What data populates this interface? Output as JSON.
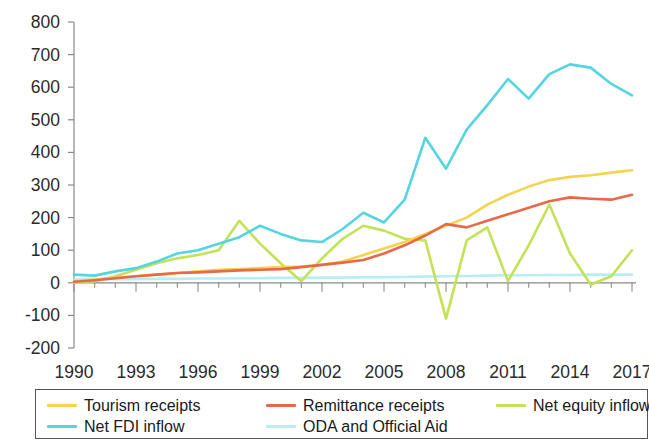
{
  "chart_data": {
    "type": "line",
    "title": "",
    "subtitle": "",
    "xlabel": "",
    "ylabel": "",
    "xlim": [
      1990,
      2017
    ],
    "ylim": [
      -200,
      800
    ],
    "ytick_values": [
      800,
      700,
      600,
      500,
      400,
      300,
      200,
      100,
      0,
      -100,
      -200
    ],
    "ytick_labels": [
      "800",
      "700",
      "600",
      "500",
      "400",
      "300",
      "200",
      "100",
      "0",
      "-100",
      "-200"
    ],
    "xtick_values": [
      1990,
      1993,
      1996,
      1999,
      2002,
      2005,
      2008,
      2011,
      2014,
      2017
    ],
    "xtick_labels": [
      "1990",
      "1993",
      "1996",
      "1999",
      "2002",
      "2005",
      "2008",
      "2011",
      "2014",
      "2017"
    ],
    "grid": false,
    "legend_position": "bottom",
    "x": [
      1990,
      1991,
      1992,
      1993,
      1994,
      1995,
      1996,
      1997,
      1998,
      1999,
      2000,
      2001,
      2002,
      2003,
      2004,
      2005,
      2006,
      2007,
      2008,
      2009,
      2010,
      2011,
      2012,
      2013,
      2014,
      2015,
      2016,
      2017
    ],
    "series": [
      {
        "name": "Tourism receipts",
        "color": "#f4d44e",
        "values": [
          5,
          10,
          15,
          20,
          25,
          30,
          35,
          40,
          42,
          45,
          48,
          50,
          55,
          65,
          85,
          105,
          125,
          150,
          175,
          200,
          240,
          270,
          295,
          315,
          325,
          330,
          338,
          345
        ]
      },
      {
        "name": "Remittance receipts",
        "color": "#e8694a",
        "values": [
          3,
          8,
          14,
          20,
          25,
          30,
          32,
          35,
          38,
          40,
          42,
          48,
          55,
          62,
          70,
          90,
          115,
          145,
          180,
          170,
          190,
          210,
          230,
          250,
          262,
          258,
          255,
          270
        ]
      },
      {
        "name": "Net equity inflow",
        "color": "#c2e356",
        "values": [
          0,
          5,
          20,
          40,
          60,
          75,
          85,
          100,
          190,
          120,
          60,
          5,
          75,
          135,
          175,
          160,
          135,
          130,
          -110,
          130,
          170,
          5,
          115,
          240,
          90,
          -5,
          20,
          100
        ]
      },
      {
        "name": "Net FDI inflow",
        "color": "#55d5e0",
        "values": [
          25,
          22,
          35,
          45,
          65,
          90,
          100,
          120,
          140,
          175,
          150,
          130,
          125,
          165,
          215,
          185,
          255,
          445,
          350,
          470,
          545,
          625,
          565,
          640,
          670,
          660,
          610,
          575
        ]
      },
      {
        "name": "ODA and Official Aid",
        "color": "#b6eef5",
        "values": [
          10,
          10,
          11,
          11,
          12,
          12,
          13,
          13,
          14,
          14,
          15,
          15,
          16,
          16,
          17,
          17,
          18,
          19,
          20,
          21,
          22,
          23,
          23,
          24,
          24,
          25,
          25,
          25
        ]
      }
    ]
  },
  "legend": {
    "rows": [
      [
        {
          "label": "Tourism receipts",
          "color": "#f4d44e",
          "series_index": 0
        },
        {
          "label": "Remittance receipts",
          "color": "#e8694a",
          "series_index": 1
        },
        {
          "label": "Net equity inflow",
          "color": "#c2e356",
          "series_index": 2
        }
      ],
      [
        {
          "label": "Net FDI inflow",
          "color": "#55d5e0",
          "series_index": 3
        },
        {
          "label": "ODA and Official Aid",
          "color": "#b6eef5",
          "series_index": 4
        }
      ]
    ]
  },
  "axis_style": {
    "spine_color": "#8a8a8a",
    "tick_color": "#8a8a8a",
    "label_color": "#2b2b2b"
  }
}
